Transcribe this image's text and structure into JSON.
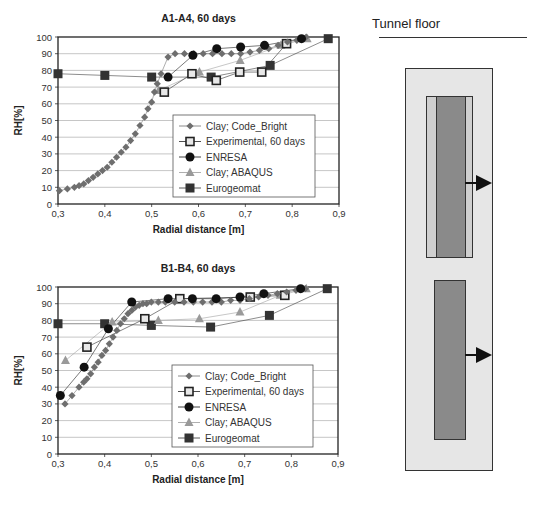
{
  "diagram": {
    "title": "Tunnel floor",
    "colors": {
      "outer_fill": "#e6e6e6",
      "inner_light_fill": "#cfcfcf",
      "canister_fill": "#8a8a8a",
      "stroke": "#333333",
      "arrow": "#111111"
    }
  },
  "charts_meta": {
    "series_style": [
      {
        "name": "Clay; Code_Bright",
        "marker": "diamond",
        "color": "#6e6e6e"
      },
      {
        "name": "Experimental, 60 days",
        "marker": "square-open",
        "color": "#222222"
      },
      {
        "name": "ENRESA",
        "marker": "circle",
        "color": "#111111"
      },
      {
        "name": "Clay; ABAQUS",
        "marker": "triangle",
        "color": "#9a9a9a"
      },
      {
        "name": "Eurogeomat",
        "marker": "square",
        "color": "#333333"
      }
    ]
  },
  "chart_data": [
    {
      "type": "scatter",
      "title": "A1-A4, 60 days",
      "xlabel": "Radial distance [m]",
      "ylabel": "RH[%]",
      "xlim": [
        0.3,
        0.9
      ],
      "ylim": [
        0,
        100
      ],
      "x_ticks": [
        "0,3",
        "0,4",
        "0,5",
        "0,6",
        "0,7",
        "0,8",
        "0,9"
      ],
      "y_ticks": [
        "0",
        "10",
        "20",
        "30",
        "40",
        "50",
        "60",
        "70",
        "80",
        "90",
        "100"
      ],
      "grid": "horizontal",
      "legend_position": "lower right (inside plot)",
      "legend": [
        "Clay; Code_Bright",
        "Experimental, 60 days",
        "ENRESA",
        "Clay; ABAQUS",
        "Eurogeomat"
      ],
      "series": [
        {
          "name": "Clay; Code_Bright",
          "x": [
            0.303,
            0.32,
            0.335,
            0.345,
            0.355,
            0.365,
            0.375,
            0.385,
            0.395,
            0.405,
            0.415,
            0.425,
            0.435,
            0.445,
            0.455,
            0.465,
            0.475,
            0.485,
            0.492,
            0.5,
            0.506,
            0.512,
            0.52,
            0.535,
            0.55,
            0.57,
            0.59,
            0.61,
            0.63,
            0.65,
            0.67,
            0.69,
            0.71,
            0.73,
            0.75,
            0.77,
            0.79,
            0.81,
            0.83
          ],
          "y": [
            8,
            9,
            10,
            11,
            12,
            14,
            16,
            18,
            20,
            22,
            25,
            28,
            31,
            34,
            38,
            42,
            47,
            52,
            57,
            61,
            67,
            72,
            78,
            88,
            90,
            90,
            90,
            90,
            90,
            90,
            90,
            90,
            91,
            92,
            93,
            95,
            97,
            98,
            100
          ]
        },
        {
          "name": "Experimental, 60 days",
          "x": [
            0.527,
            0.586,
            0.638,
            0.688,
            0.735,
            0.788
          ],
          "y": [
            67,
            78,
            74,
            79,
            79,
            96
          ]
        },
        {
          "name": "ENRESA",
          "x": [
            0.535,
            0.588,
            0.639,
            0.69,
            0.741,
            0.82
          ],
          "y": [
            76,
            89,
            93,
            94,
            95,
            99
          ]
        },
        {
          "name": "Clay; ABAQUS",
          "x": [
            0.515,
            0.602,
            0.689,
            0.776,
            0.832
          ],
          "y": [
            68,
            79,
            86,
            95,
            99
          ]
        },
        {
          "name": "Eurogeomat",
          "x": [
            0.3,
            0.4,
            0.5,
            0.627,
            0.753,
            0.877
          ],
          "y": [
            78,
            77,
            76,
            76,
            83,
            99
          ]
        }
      ]
    },
    {
      "type": "scatter",
      "title": "B1-B4, 60 days",
      "xlabel": "Radial distance [m]",
      "ylabel": "RH[%]",
      "xlim": [
        0.3,
        0.9
      ],
      "ylim": [
        0,
        100
      ],
      "x_ticks": [
        "0,3",
        "0,4",
        "0,5",
        "0,6",
        "0,7",
        "0,8",
        "0,9"
      ],
      "y_ticks": [
        "0",
        "10",
        "20",
        "30",
        "40",
        "50",
        "60",
        "70",
        "80",
        "90",
        "100"
      ],
      "grid": "horizontal",
      "legend_position": "lower right (inside plot)",
      "legend": [
        "Clay;  Code_Bright",
        "Experimental, 60 days",
        "ENRESA",
        "Clay; ABAQUS",
        "Eurogeomat"
      ],
      "series": [
        {
          "name": "Clay;  Code_Bright",
          "x": [
            0.315,
            0.33,
            0.345,
            0.355,
            0.362,
            0.37,
            0.378,
            0.386,
            0.394,
            0.402,
            0.41,
            0.418,
            0.426,
            0.434,
            0.442,
            0.45,
            0.458,
            0.466,
            0.474,
            0.482,
            0.49,
            0.5,
            0.515,
            0.53,
            0.55,
            0.57,
            0.59,
            0.61,
            0.63,
            0.65,
            0.67,
            0.69,
            0.71,
            0.73,
            0.75,
            0.77,
            0.79,
            0.81,
            0.83
          ],
          "y": [
            30,
            35,
            40,
            43,
            45,
            48,
            52,
            55,
            59,
            62,
            66,
            70,
            74,
            78,
            81,
            84,
            86,
            88,
            89,
            90,
            90,
            91,
            91,
            91,
            91,
            91,
            91,
            91,
            91,
            91,
            92,
            92,
            93,
            94,
            95,
            96,
            97,
            98,
            99
          ]
        },
        {
          "name": "Experimental, 60 days",
          "x": [
            0.362,
            0.486,
            0.561,
            0.712,
            0.786
          ],
          "y": [
            64,
            81,
            93,
            94,
            95
          ]
        },
        {
          "name": "ENRESA",
          "x": [
            0.305,
            0.356,
            0.408,
            0.458,
            0.536,
            0.588,
            0.639,
            0.69,
            0.741,
            0.82
          ],
          "y": [
            35,
            52,
            75,
            91,
            93,
            93,
            93,
            94,
            96,
            99
          ]
        },
        {
          "name": "Clay; ABAQUS",
          "x": [
            0.316,
            0.416,
            0.515,
            0.603,
            0.69,
            0.776,
            0.832
          ],
          "y": [
            56,
            79,
            80,
            81,
            85,
            95,
            99
          ]
        },
        {
          "name": "Eurogeomat",
          "x": [
            0.3,
            0.4,
            0.5,
            0.627,
            0.753,
            0.877
          ],
          "y": [
            78,
            78,
            77,
            76,
            83,
            99
          ]
        }
      ]
    }
  ]
}
